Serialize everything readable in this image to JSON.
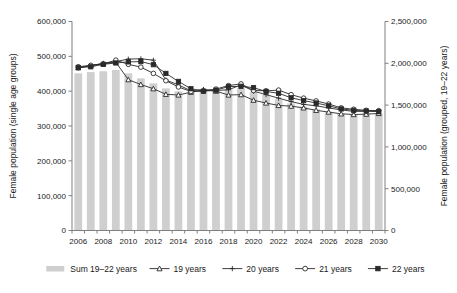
{
  "chart_data": {
    "type": "bar",
    "title": "",
    "subtitle": "",
    "xlabel": "",
    "ylabel": "Female population (single age groups)",
    "y2label": "Female population (grouped, 19–22 years)",
    "grid": false,
    "legend_position": "bottom",
    "x": [
      2006,
      2007,
      2008,
      2009,
      2010,
      2011,
      2012,
      2013,
      2014,
      2015,
      2016,
      2017,
      2018,
      2019,
      2020,
      2021,
      2022,
      2023,
      2024,
      2025,
      2026,
      2027,
      2028,
      2029,
      2030
    ],
    "xtick_labels": [
      "2006",
      "2008",
      "2010",
      "2012",
      "2014",
      "2016",
      "2018",
      "2020",
      "2022",
      "2024",
      "2026",
      "2028",
      "2030"
    ],
    "xtick_values": [
      2006,
      2008,
      2010,
      2012,
      2014,
      2016,
      2018,
      2020,
      2022,
      2024,
      2026,
      2028,
      2030
    ],
    "ylim": [
      0,
      600000
    ],
    "ytick_labels": [
      "0",
      "100,000",
      "200,000",
      "300,000",
      "400,000",
      "500,000",
      "600,000"
    ],
    "ytick_values": [
      0,
      100000,
      200000,
      300000,
      400000,
      500000,
      600000
    ],
    "y2lim": [
      0,
      2500000
    ],
    "y2tick_labels": [
      "0",
      "500,000",
      "1,000,000",
      "1,500,000",
      "2,000,000",
      "2,500,000"
    ],
    "y2tick_values": [
      0,
      500000,
      1000000,
      1500000,
      2000000,
      2500000
    ],
    "bar_series": {
      "name": "Sum 19–22 years",
      "axis": "right",
      "color": "#cfcfcf",
      "values": [
        1880000,
        1895000,
        1905000,
        1920000,
        1880000,
        1820000,
        1760000,
        1700000,
        1665000,
        1660000,
        1670000,
        1680000,
        1690000,
        1700000,
        1660000,
        1620000,
        1570000,
        1520000,
        1480000,
        1450000,
        1420000,
        1400000,
        1395000,
        1400000,
        1405000
      ]
    },
    "series": [
      {
        "name": "19 years",
        "marker": "triangle-open",
        "axis": "left",
        "values": [
          467000,
          474000,
          479000,
          483000,
          433000,
          419000,
          407000,
          391000,
          389000,
          397000,
          403000,
          400000,
          389000,
          390000,
          374000,
          366000,
          359000,
          357000,
          352000,
          345000,
          340000,
          335000,
          333000,
          334000,
          336000
        ]
      },
      {
        "name": "20 years",
        "marker": "plus",
        "axis": "left",
        "values": [
          467000,
          473000,
          480000,
          485000,
          492000,
          493000,
          489000,
          432000,
          418000,
          401000,
          405000,
          402000,
          404000,
          418000,
          400000,
          390000,
          380000,
          370000,
          362000,
          358000,
          352000,
          346000,
          342000,
          342000,
          344000
        ]
      },
      {
        "name": "21 years",
        "marker": "circle-open",
        "axis": "left",
        "values": [
          470000,
          474000,
          478000,
          489000,
          477000,
          469000,
          451000,
          430000,
          412000,
          399000,
          400000,
          406000,
          416000,
          421000,
          402000,
          401000,
          403000,
          390000,
          380000,
          372000,
          363000,
          352000,
          348000,
          345000,
          344000
        ]
      },
      {
        "name": "22 years",
        "marker": "square-solid",
        "axis": "left",
        "values": [
          468000,
          470000,
          477000,
          481000,
          484000,
          485000,
          476000,
          451000,
          428000,
          407000,
          400000,
          403000,
          413000,
          414000,
          410000,
          399000,
          394000,
          381000,
          373000,
          366000,
          358000,
          349000,
          345000,
          343000,
          341000
        ]
      }
    ],
    "legend": [
      {
        "label": "Sum 19–22 years",
        "marker": "bar"
      },
      {
        "label": "19 years",
        "marker": "triangle-open"
      },
      {
        "label": "20 years",
        "marker": "plus"
      },
      {
        "label": "21 years",
        "marker": "circle-open"
      },
      {
        "label": "22 years",
        "marker": "square-solid"
      }
    ]
  }
}
